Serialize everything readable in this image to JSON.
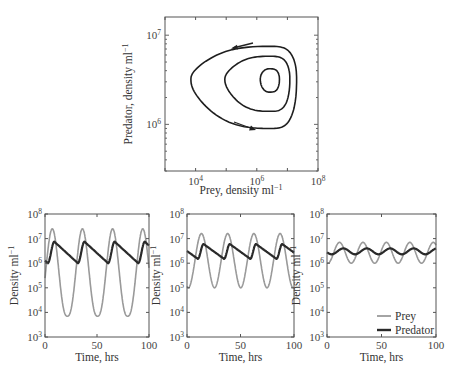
{
  "chart_data": [
    {
      "type": "line",
      "subtype": "phase-plane",
      "title": "",
      "xlabel": "Prey, density ml⁻¹",
      "ylabel": "Predator, density ml⁻¹",
      "xscale": "log",
      "yscale": "log",
      "xlim": [
        1000,
        100000000
      ],
      "ylim": [
        300000,
        16000000
      ],
      "xticks": [
        {
          "value": 10000,
          "label": "10",
          "exp": "4"
        },
        {
          "value": 1000000,
          "label": "10",
          "exp": "6"
        },
        {
          "value": 100000000,
          "label": "10",
          "exp": "8"
        }
      ],
      "yticks": [
        {
          "value": 1000000,
          "label": "10",
          "exp": "6"
        },
        {
          "value": 10000000,
          "label": "10",
          "exp": "7"
        }
      ],
      "orbits": [
        {
          "name": "outer orbit",
          "prey_min": 7000,
          "prey_max": 20000000,
          "pred_min": 900000,
          "pred_max": 7500000,
          "center_prey": 2500000,
          "center_pred": 3200000
        },
        {
          "name": "middle orbit",
          "prey_min": 90000,
          "prey_max": 12000000,
          "pred_min": 1400000,
          "pred_max": 5800000,
          "center_prey": 2500000,
          "center_pred": 3200000
        },
        {
          "name": "inner orbit",
          "prey_min": 1300000,
          "prey_max": 5500000,
          "pred_min": 2300000,
          "pred_max": 4200000,
          "center_prey": 2500000,
          "center_pred": 3200000
        }
      ],
      "annotations": [
        "arrow top pointing left (counter-clockwise flow)",
        "arrow bottom pointing right"
      ]
    },
    {
      "type": "line",
      "panel": "left",
      "xlabel": "Time, hrs",
      "ylabel": "Density ml⁻¹",
      "yscale": "log",
      "xlim": [
        0,
        100
      ],
      "ylim": [
        1000,
        100000000
      ],
      "xticks": [
        0,
        50,
        100
      ],
      "yticks": [
        "10^3",
        "10^4",
        "10^5",
        "10^6",
        "10^7",
        "10^8"
      ],
      "series": [
        {
          "name": "Prey",
          "color": "#9a9a9a",
          "period": 29,
          "phase_peak": 7,
          "min": 7000,
          "max": 25000000
        },
        {
          "name": "Predator",
          "color": "#2a2a2a",
          "period": 29,
          "phase_peak": 9,
          "min": 1000000,
          "max": 7500000
        }
      ]
    },
    {
      "type": "line",
      "panel": "middle",
      "xlabel": "Time, hrs",
      "ylabel": "Density ml⁻¹",
      "yscale": "log",
      "xlim": [
        0,
        100
      ],
      "ylim": [
        1000,
        100000000
      ],
      "xticks": [
        0,
        50,
        100
      ],
      "yticks": [
        "10^3",
        "10^4",
        "10^5",
        "10^6",
        "10^7",
        "10^8"
      ],
      "series": [
        {
          "name": "Prey",
          "color": "#9a9a9a",
          "period": 24.5,
          "phase_peak": 13.5,
          "min": 100000,
          "max": 16000000
        },
        {
          "name": "Predator",
          "color": "#2a2a2a",
          "period": 24.5,
          "phase_peak": 15.5,
          "min": 1500000,
          "max": 6000000
        }
      ]
    },
    {
      "type": "line",
      "panel": "right",
      "xlabel": "Time, hrs",
      "ylabel": "Density ml⁻¹",
      "yscale": "log",
      "xlim": [
        0,
        100
      ],
      "ylim": [
        1000,
        100000000
      ],
      "xticks": [
        0,
        50,
        100
      ],
      "yticks": [
        "10^3",
        "10^4",
        "10^5",
        "10^6",
        "10^7",
        "10^8"
      ],
      "legend": {
        "position": "lower right",
        "entries": [
          "Prey",
          "Predator"
        ]
      },
      "series": [
        {
          "name": "Prey",
          "color": "#9a9a9a",
          "period": 21.5,
          "phase_peak": 11.5,
          "min": 1000000,
          "max": 7000000
        },
        {
          "name": "Predator",
          "color": "#2a2a2a",
          "period": 21.5,
          "phase_peak": 15,
          "min": 2300000,
          "max": 4000000
        }
      ]
    }
  ],
  "labels": {
    "phase_xlabel": "Prey, density ml",
    "phase_ylabel": "Predator, density ml",
    "time_xlabel": "Time, hrs",
    "density_ylabel": "Density ml",
    "inv_exp": "−1",
    "legend_prey": "Prey",
    "legend_predator": "Predator"
  }
}
